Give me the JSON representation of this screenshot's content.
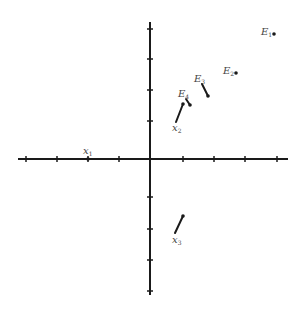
{
  "diagram": {
    "type": "vector-plot",
    "colors": {
      "ink": "#1a1a1a",
      "label": "#444444",
      "background": "#ffffff"
    },
    "axes": {
      "origin": [
        150,
        159
      ],
      "x_range": [
        18,
        288
      ],
      "y_range": [
        22,
        295
      ],
      "x_ticks": [
        26,
        57,
        88,
        119,
        183,
        214,
        245,
        277
      ],
      "y_ticks": [
        29,
        59,
        90,
        121,
        197,
        229,
        260,
        291
      ]
    },
    "points": [
      {
        "id": "E1",
        "base": "E",
        "sub": "1",
        "dot": [
          274,
          34
        ],
        "label_pos": [
          261,
          35
        ],
        "line": null
      },
      {
        "id": "E2",
        "base": "E",
        "sub": "2",
        "dot": [
          236,
          73
        ],
        "label_pos": [
          223,
          74
        ],
        "line": null
      },
      {
        "id": "E3",
        "base": "E",
        "sub": "3",
        "dot": [
          208,
          96
        ],
        "label_pos": [
          194,
          82
        ],
        "line": [
          [
            202,
            84
          ],
          [
            208,
            96
          ]
        ]
      },
      {
        "id": "E4",
        "base": "E",
        "sub": "4",
        "dot": [
          190,
          105
        ],
        "label_pos": [
          178,
          97
        ],
        "line": [
          [
            186,
            99
          ],
          [
            190,
            105
          ]
        ]
      },
      {
        "id": "x2",
        "base": "x",
        "sub": "2",
        "dot": [
          183,
          104
        ],
        "label_pos": [
          172,
          131
        ],
        "line": [
          [
            183,
            104
          ],
          [
            176,
            122
          ]
        ]
      },
      {
        "id": "x1",
        "base": "x",
        "sub": "1",
        "dot": [
          88,
          159
        ],
        "label_pos": [
          83,
          154
        ],
        "line": null
      },
      {
        "id": "x3",
        "base": "x",
        "sub": "3",
        "dot": [
          183,
          216
        ],
        "label_pos": [
          172,
          243
        ],
        "line": [
          [
            183,
            216
          ],
          [
            175,
            233
          ]
        ]
      }
    ]
  }
}
